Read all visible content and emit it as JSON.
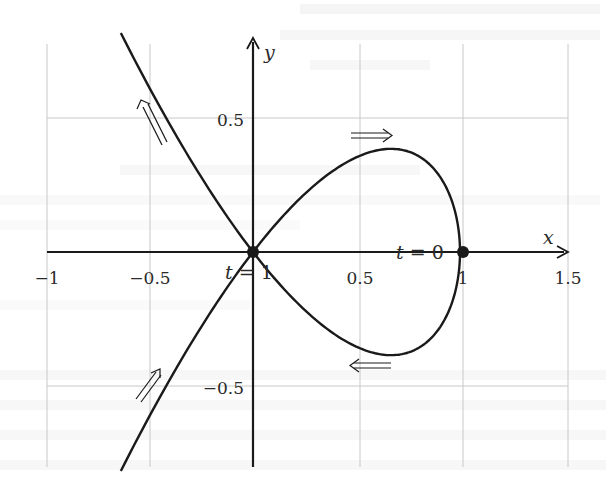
{
  "figure": {
    "title": "",
    "axes": {
      "x_label": "x",
      "y_label": "y",
      "x_ticks": [
        {
          "value": -1,
          "label": "−1"
        },
        {
          "value": -0.5,
          "label": "−0.5"
        },
        {
          "value": 0.5,
          "label": "0.5"
        },
        {
          "value": 1,
          "label": "1"
        },
        {
          "value": 1.5,
          "label": "1.5"
        }
      ],
      "y_ticks": [
        {
          "value": 0.5,
          "label": "0.5"
        },
        {
          "value": -0.5,
          "label": "−0.5"
        }
      ],
      "grid": true
    },
    "annotations": {
      "t0_var": "t",
      "t0_eq": " = 0",
      "t1_var": "t",
      "t1_eq": " = 1"
    },
    "points": [
      {
        "name": "t=0",
        "x": 1,
        "y": 0
      },
      {
        "name": "t=1",
        "x": 0,
        "y": 0
      }
    ],
    "curve": {
      "description": "Parametric nodal curve x = 1 − t², y = t(1 − t²) with self-intersection at origin",
      "t_range": [
        -1.28,
        1.28
      ],
      "direction_arrows": [
        "upper-left ray: up-left",
        "loop top: rightward",
        "loop bottom: leftward",
        "lower-left ray: up-right"
      ]
    },
    "colors": {
      "ink": "#1a1a1a",
      "grid": "#c8c8c8",
      "background": "#ffffff"
    }
  }
}
